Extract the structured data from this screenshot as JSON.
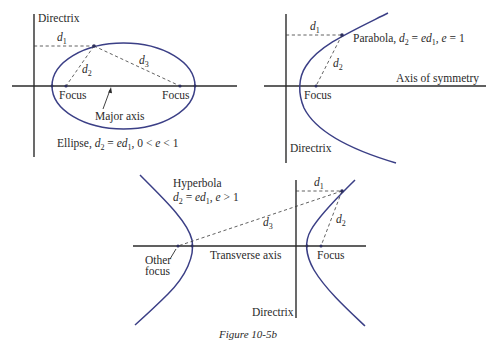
{
  "figure": {
    "caption": "Figure 10-5b",
    "colors": {
      "curve": "#3b3f86",
      "axis": "#2b2b2b",
      "text": "#2a2a2a",
      "background": "#ffffff"
    }
  },
  "ellipse": {
    "directrix_label": "Directrix",
    "d1": "d",
    "d1_sub": "1",
    "d2": "d",
    "d2_sub": "2",
    "d3": "d",
    "d3_sub": "3",
    "focus_left": "Focus",
    "focus_right": "Focus",
    "major_axis_label": "Major axis",
    "title_prefix": "Ellipse, ",
    "eq_d": "d",
    "eq_d_sub": "2",
    "eq_eq": " = ",
    "eq_e": "e",
    "eq_d1": "d",
    "eq_d1_sub": "1",
    "eq_tail": ", 0 < ",
    "eq_e2": "e",
    "eq_end": " < 1"
  },
  "parabola": {
    "directrix_label": "Directrix",
    "d1": "d",
    "d1_sub": "1",
    "d2": "d",
    "d2_sub": "2",
    "focus_label": "Focus",
    "axis_label": "Axis of symmetry",
    "title_prefix": "Parabola, ",
    "eq_d": "d",
    "eq_d_sub": "2",
    "eq_eq": " = ",
    "eq_e": "e",
    "eq_d1": "d",
    "eq_d1_sub": "1",
    "eq_tail": ", ",
    "eq_e2": "e",
    "eq_end": " = 1"
  },
  "hyperbola": {
    "title": "Hyperbola",
    "eq_d": "d",
    "eq_d_sub": "2",
    "eq_eq": " = ",
    "eq_e": "e",
    "eq_d1": "d",
    "eq_d1_sub": "1",
    "eq_tail": ", ",
    "eq_e2": "e",
    "eq_end": " > 1",
    "d1": "d",
    "d1_sub": "1",
    "d2": "d",
    "d2_sub": "2",
    "d3": "d",
    "d3_sub": "3",
    "other_focus_line1": "Other",
    "other_focus_line2": "focus",
    "transverse_axis_label": "Transverse axis",
    "focus_label": "Focus",
    "directrix_label": "Directrix"
  }
}
